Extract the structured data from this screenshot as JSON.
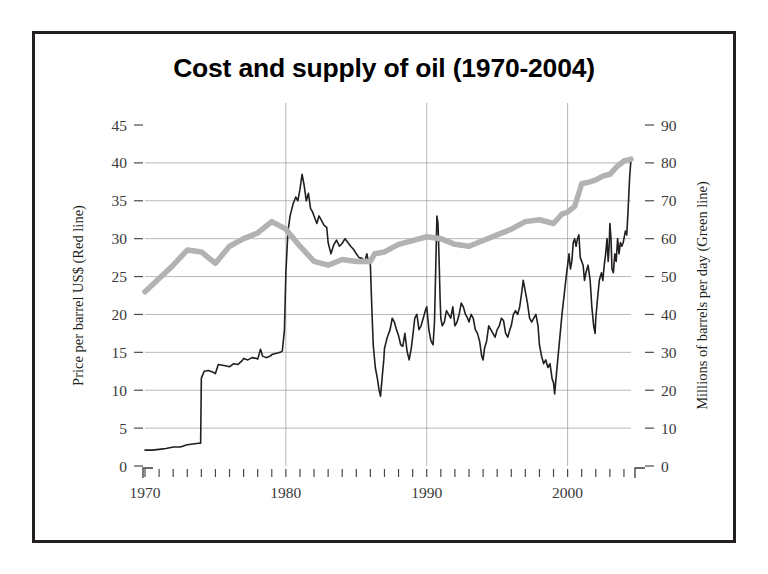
{
  "figure": {
    "title": "Cost and supply of oil (1970-2004)",
    "background": "#ffffff",
    "border_color": "#231f20"
  },
  "chart_data": {
    "type": "line",
    "title": "Cost and supply of oil (1970-2004)",
    "xlabel": "",
    "ylabel": "Price per barrel US$ (Red line)",
    "y2label": "Millions of barrels per day (Green line)",
    "xlim": [
      1970,
      2004.5
    ],
    "ylim": [
      0,
      45
    ],
    "y2lim": [
      0,
      90
    ],
    "grid": true,
    "legend_position": "none",
    "x_tick_labels": [
      "1970",
      "1980",
      "1990",
      "2000"
    ],
    "x_tick_label_values": [
      1970,
      1980,
      1990,
      2000
    ],
    "x_minor_tick_step": 1,
    "y_ticks": [
      0,
      5,
      10,
      15,
      20,
      25,
      30,
      35,
      40,
      45
    ],
    "y2_ticks": [
      0,
      10,
      20,
      30,
      40,
      50,
      60,
      70,
      80,
      90
    ],
    "gridline_values": [
      5,
      10,
      15,
      20,
      25,
      30,
      35,
      40
    ],
    "vertical_gridline_values": [
      1980,
      1990,
      2000
    ],
    "series": [
      {
        "name": "Price per barrel US$",
        "axis": "left",
        "color": "#231f20",
        "stroke_width": 1.6,
        "points": [
          [
            1970.0,
            2.1
          ],
          [
            1970.5,
            2.1
          ],
          [
            1971.0,
            2.2
          ],
          [
            1971.5,
            2.3
          ],
          [
            1972.0,
            2.5
          ],
          [
            1972.5,
            2.5
          ],
          [
            1973.0,
            2.8
          ],
          [
            1973.4,
            2.9
          ],
          [
            1973.8,
            3.0
          ],
          [
            1973.95,
            3.0
          ],
          [
            1974.0,
            11.6
          ],
          [
            1974.2,
            12.5
          ],
          [
            1974.5,
            12.6
          ],
          [
            1974.8,
            12.4
          ],
          [
            1975.0,
            12.2
          ],
          [
            1975.2,
            13.4
          ],
          [
            1975.5,
            13.3
          ],
          [
            1975.8,
            13.2
          ],
          [
            1976.0,
            13.1
          ],
          [
            1976.3,
            13.5
          ],
          [
            1976.6,
            13.4
          ],
          [
            1976.9,
            13.9
          ],
          [
            1977.0,
            14.2
          ],
          [
            1977.3,
            14.0
          ],
          [
            1977.6,
            14.3
          ],
          [
            1977.9,
            14.2
          ],
          [
            1978.0,
            14.1
          ],
          [
            1978.2,
            15.4
          ],
          [
            1978.35,
            14.5
          ],
          [
            1978.6,
            14.3
          ],
          [
            1978.9,
            14.5
          ],
          [
            1979.0,
            14.7
          ],
          [
            1979.2,
            14.8
          ],
          [
            1979.4,
            14.9
          ],
          [
            1979.6,
            15.0
          ],
          [
            1979.75,
            15.2
          ],
          [
            1979.9,
            18.0
          ],
          [
            1980.0,
            25.5
          ],
          [
            1980.15,
            31.0
          ],
          [
            1980.3,
            33.0
          ],
          [
            1980.5,
            34.5
          ],
          [
            1980.7,
            35.5
          ],
          [
            1980.85,
            35.0
          ],
          [
            1981.0,
            36.5
          ],
          [
            1981.15,
            38.5
          ],
          [
            1981.3,
            37.0
          ],
          [
            1981.45,
            35.0
          ],
          [
            1981.6,
            36.0
          ],
          [
            1981.75,
            34.0
          ],
          [
            1981.9,
            33.5
          ],
          [
            1982.0,
            33.0
          ],
          [
            1982.2,
            32.0
          ],
          [
            1982.35,
            33.0
          ],
          [
            1982.5,
            32.5
          ],
          [
            1982.7,
            31.8
          ],
          [
            1982.9,
            31.5
          ],
          [
            1983.0,
            29.5
          ],
          [
            1983.2,
            28.0
          ],
          [
            1983.4,
            29.2
          ],
          [
            1983.6,
            29.8
          ],
          [
            1983.8,
            29.0
          ],
          [
            1984.0,
            29.4
          ],
          [
            1984.2,
            30.0
          ],
          [
            1984.4,
            29.5
          ],
          [
            1984.6,
            29.0
          ],
          [
            1984.8,
            28.6
          ],
          [
            1985.0,
            28.0
          ],
          [
            1985.2,
            27.5
          ],
          [
            1985.4,
            27.4
          ],
          [
            1985.6,
            27.0
          ],
          [
            1985.75,
            28.0
          ],
          [
            1985.85,
            27.0
          ],
          [
            1985.95,
            26.8
          ],
          [
            1986.0,
            26.5
          ],
          [
            1986.08,
            22.0
          ],
          [
            1986.2,
            16.0
          ],
          [
            1986.35,
            13.0
          ],
          [
            1986.5,
            11.5
          ],
          [
            1986.62,
            10.0
          ],
          [
            1986.72,
            9.2
          ],
          [
            1986.85,
            12.0
          ],
          [
            1986.95,
            14.0
          ],
          [
            1987.0,
            15.5
          ],
          [
            1987.2,
            17.0
          ],
          [
            1987.4,
            18.0
          ],
          [
            1987.55,
            19.5
          ],
          [
            1987.7,
            19.0
          ],
          [
            1987.85,
            18.0
          ],
          [
            1988.0,
            17.2
          ],
          [
            1988.15,
            16.0
          ],
          [
            1988.3,
            15.8
          ],
          [
            1988.45,
            17.5
          ],
          [
            1988.6,
            15.2
          ],
          [
            1988.75,
            14.0
          ],
          [
            1988.9,
            15.5
          ],
          [
            1989.0,
            17.0
          ],
          [
            1989.15,
            19.5
          ],
          [
            1989.3,
            20.0
          ],
          [
            1989.45,
            18.0
          ],
          [
            1989.6,
            18.5
          ],
          [
            1989.75,
            19.5
          ],
          [
            1989.9,
            20.5
          ],
          [
            1990.0,
            21.0
          ],
          [
            1990.15,
            18.0
          ],
          [
            1990.3,
            16.5
          ],
          [
            1990.45,
            16.0
          ],
          [
            1990.55,
            19.0
          ],
          [
            1990.65,
            27.0
          ],
          [
            1990.72,
            33.0
          ],
          [
            1990.8,
            32.0
          ],
          [
            1990.88,
            27.0
          ],
          [
            1990.95,
            22.0
          ],
          [
            1991.0,
            19.5
          ],
          [
            1991.1,
            18.5
          ],
          [
            1991.25,
            19.0
          ],
          [
            1991.4,
            20.5
          ],
          [
            1991.55,
            20.0
          ],
          [
            1991.7,
            19.5
          ],
          [
            1991.85,
            21.0
          ],
          [
            1992.0,
            18.5
          ],
          [
            1992.15,
            19.0
          ],
          [
            1992.3,
            20.0
          ],
          [
            1992.45,
            21.5
          ],
          [
            1992.6,
            21.0
          ],
          [
            1992.75,
            20.0
          ],
          [
            1992.9,
            19.5
          ],
          [
            1993.0,
            19.0
          ],
          [
            1993.15,
            20.0
          ],
          [
            1993.3,
            19.5
          ],
          [
            1993.45,
            18.0
          ],
          [
            1993.6,
            17.5
          ],
          [
            1993.75,
            16.5
          ],
          [
            1993.9,
            14.5
          ],
          [
            1994.0,
            14.0
          ],
          [
            1994.1,
            15.5
          ],
          [
            1994.25,
            16.5
          ],
          [
            1994.4,
            18.5
          ],
          [
            1994.55,
            18.0
          ],
          [
            1994.7,
            17.5
          ],
          [
            1994.85,
            17.0
          ],
          [
            1995.0,
            18.0
          ],
          [
            1995.15,
            18.5
          ],
          [
            1995.3,
            19.5
          ],
          [
            1995.45,
            19.2
          ],
          [
            1995.6,
            17.5
          ],
          [
            1995.75,
            17.0
          ],
          [
            1995.9,
            18.0
          ],
          [
            1996.0,
            18.5
          ],
          [
            1996.15,
            20.0
          ],
          [
            1996.3,
            20.5
          ],
          [
            1996.45,
            20.0
          ],
          [
            1996.6,
            21.0
          ],
          [
            1996.75,
            23.0
          ],
          [
            1996.85,
            24.5
          ],
          [
            1996.95,
            23.5
          ],
          [
            1997.0,
            23.0
          ],
          [
            1997.15,
            21.5
          ],
          [
            1997.3,
            19.5
          ],
          [
            1997.45,
            19.0
          ],
          [
            1997.6,
            19.5
          ],
          [
            1997.75,
            20.0
          ],
          [
            1997.9,
            18.5
          ],
          [
            1998.0,
            16.0
          ],
          [
            1998.15,
            14.5
          ],
          [
            1998.3,
            13.5
          ],
          [
            1998.45,
            14.0
          ],
          [
            1998.6,
            13.0
          ],
          [
            1998.75,
            13.5
          ],
          [
            1998.9,
            11.5
          ],
          [
            1999.0,
            11.0
          ],
          [
            1999.08,
            9.5
          ],
          [
            1999.15,
            11.0
          ],
          [
            1999.3,
            14.0
          ],
          [
            1999.45,
            17.0
          ],
          [
            1999.6,
            20.0
          ],
          [
            1999.75,
            22.5
          ],
          [
            1999.9,
            25.0
          ],
          [
            2000.0,
            26.5
          ],
          [
            2000.1,
            28.0
          ],
          [
            2000.2,
            26.0
          ],
          [
            2000.3,
            27.0
          ],
          [
            2000.4,
            29.5
          ],
          [
            2000.5,
            30.0
          ],
          [
            2000.6,
            29.0
          ],
          [
            2000.7,
            30.0
          ],
          [
            2000.8,
            30.5
          ],
          [
            2000.9,
            27.5
          ],
          [
            2001.0,
            27.0
          ],
          [
            2001.1,
            26.5
          ],
          [
            2001.2,
            24.5
          ],
          [
            2001.3,
            25.5
          ],
          [
            2001.45,
            26.5
          ],
          [
            2001.6,
            24.5
          ],
          [
            2001.72,
            21.0
          ],
          [
            2001.85,
            18.5
          ],
          [
            2001.95,
            17.5
          ],
          [
            2002.0,
            19.5
          ],
          [
            2002.12,
            22.0
          ],
          [
            2002.25,
            24.5
          ],
          [
            2002.4,
            25.5
          ],
          [
            2002.5,
            24.5
          ],
          [
            2002.6,
            26.5
          ],
          [
            2002.7,
            28.0
          ],
          [
            2002.8,
            30.0
          ],
          [
            2002.88,
            27.0
          ],
          [
            2002.95,
            29.0
          ],
          [
            2003.0,
            32.0
          ],
          [
            2003.08,
            30.0
          ],
          [
            2003.15,
            26.0
          ],
          [
            2003.25,
            25.5
          ],
          [
            2003.35,
            28.0
          ],
          [
            2003.45,
            27.0
          ],
          [
            2003.55,
            30.0
          ],
          [
            2003.65,
            28.0
          ],
          [
            2003.75,
            29.5
          ],
          [
            2003.85,
            29.0
          ],
          [
            2003.95,
            29.5
          ],
          [
            2004.0,
            30.0
          ],
          [
            2004.1,
            31.0
          ],
          [
            2004.2,
            30.5
          ],
          [
            2004.3,
            34.0
          ],
          [
            2004.4,
            38.0
          ],
          [
            2004.5,
            40.5
          ]
        ]
      },
      {
        "name": "Millions of barrels per day",
        "axis": "right",
        "color": "#b2b2b2",
        "stroke_width": 5.5,
        "points": [
          [
            1970.0,
            46.0
          ],
          [
            1971.0,
            49.5
          ],
          [
            1972.0,
            53.0
          ],
          [
            1973.0,
            57.0
          ],
          [
            1974.0,
            56.5
          ],
          [
            1975.0,
            53.5
          ],
          [
            1976.0,
            58.0
          ],
          [
            1977.0,
            60.0
          ],
          [
            1978.0,
            61.5
          ],
          [
            1979.0,
            64.5
          ],
          [
            1980.0,
            62.5
          ],
          [
            1981.0,
            58.0
          ],
          [
            1982.0,
            54.0
          ],
          [
            1983.0,
            53.0
          ],
          [
            1984.0,
            54.5
          ],
          [
            1985.0,
            54.0
          ],
          [
            1986.0,
            54.0
          ],
          [
            1986.3,
            56.0
          ],
          [
            1987.0,
            56.5
          ],
          [
            1988.0,
            58.5
          ],
          [
            1989.0,
            59.5
          ],
          [
            1990.0,
            60.5
          ],
          [
            1991.0,
            60.0
          ],
          [
            1992.0,
            58.5
          ],
          [
            1993.0,
            58.0
          ],
          [
            1994.0,
            59.5
          ],
          [
            1995.0,
            61.0
          ],
          [
            1996.0,
            62.5
          ],
          [
            1997.0,
            64.5
          ],
          [
            1998.0,
            65.0
          ],
          [
            1999.0,
            64.0
          ],
          [
            1999.6,
            66.5
          ],
          [
            2000.0,
            67.0
          ],
          [
            2000.5,
            68.5
          ],
          [
            2001.0,
            74.5
          ],
          [
            2001.6,
            75.0
          ],
          [
            2002.0,
            75.5
          ],
          [
            2002.5,
            76.5
          ],
          [
            2003.0,
            77.0
          ],
          [
            2003.5,
            79.0
          ],
          [
            2004.0,
            80.5
          ],
          [
            2004.5,
            81.0
          ]
        ]
      }
    ]
  }
}
